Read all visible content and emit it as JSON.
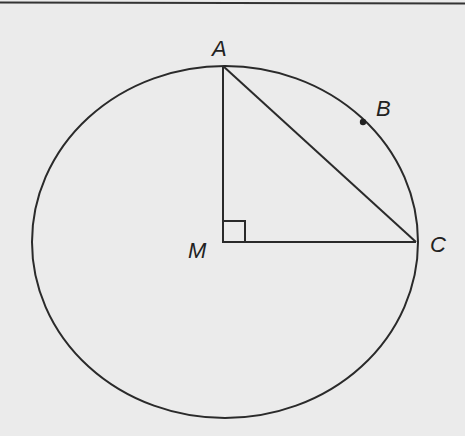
{
  "diagram": {
    "type": "geometry",
    "colors": {
      "background": "#ebebeb",
      "stroke": "#2a2a2a"
    },
    "circle": {
      "center": "M",
      "cx": 225,
      "cy": 242,
      "rx": 193,
      "ry": 176
    },
    "points": {
      "A": {
        "label": "A",
        "x": 223,
        "y": 66
      },
      "B": {
        "label": "B",
        "x": 363,
        "y": 122
      },
      "C": {
        "label": "C",
        "x": 416,
        "y": 242
      },
      "M": {
        "label": "M",
        "x": 223,
        "y": 242
      }
    },
    "segments": [
      "AM",
      "MC",
      "AC"
    ],
    "right_angle_at": "M"
  }
}
